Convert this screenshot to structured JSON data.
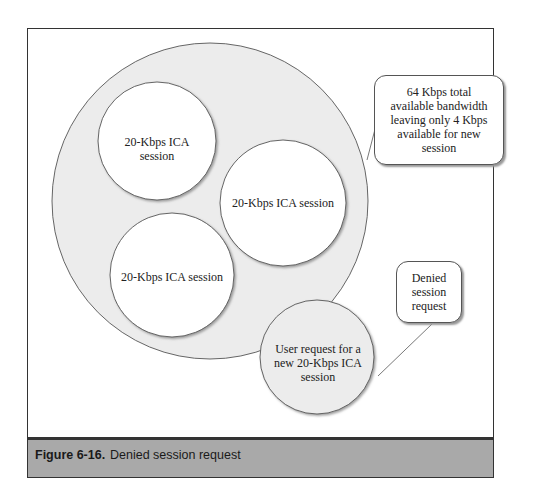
{
  "figure": {
    "number": "Figure 6-16.",
    "caption": "Denied session request"
  },
  "diagram": {
    "pool_label": "",
    "sessions": [
      {
        "label": "20-Kbps ICA session"
      },
      {
        "label": "20-Kbps ICA session"
      },
      {
        "label": "20-Kbps ICA session"
      }
    ],
    "request": {
      "label": "User request for a new 20-Kbps ICA session"
    },
    "callouts": {
      "bandwidth": "64 Kbps total available bandwidth leaving only 4 Kbps available for new session",
      "denied": "Denied session request"
    }
  }
}
